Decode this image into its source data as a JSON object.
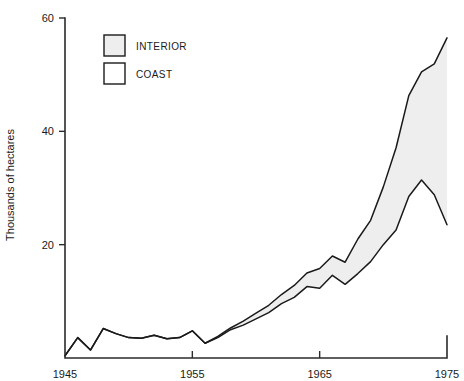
{
  "chart_data": {
    "type": "area",
    "title": "",
    "subtitle": "",
    "xlabel": "",
    "ylabel": "Thousands of hectares",
    "xlim": [
      1945,
      1975
    ],
    "ylim": [
      0,
      60
    ],
    "xticks": [
      1945,
      1955,
      1965,
      1975
    ],
    "xtick_labels": [
      "1945",
      "1955",
      "1965",
      "1975"
    ],
    "yticks": [
      20,
      40,
      60
    ],
    "ytick_labels": [
      "20",
      "40",
      "60"
    ],
    "grid": false,
    "legend_position": "top-left",
    "stacked": true,
    "x": [
      1945,
      1946,
      1947,
      1948,
      1949,
      1950,
      1951,
      1952,
      1953,
      1954,
      1955,
      1956,
      1957,
      1958,
      1959,
      1960,
      1961,
      1962,
      1963,
      1964,
      1965,
      1966,
      1967,
      1968,
      1969,
      1970,
      1971,
      1972,
      1973,
      1974,
      1975
    ],
    "series": [
      {
        "name": "COAST",
        "fill_color": "#ffffff",
        "values": [
          0.4,
          3.6,
          1.4,
          5.2,
          4.3,
          3.6,
          3.5,
          4.0,
          3.4,
          3.6,
          4.8,
          2.6,
          3.6,
          5.0,
          5.8,
          6.9,
          8.0,
          9.6,
          10.7,
          12.6,
          12.3,
          14.6,
          13.0,
          14.9,
          17.0,
          20.0,
          22.6,
          28.5,
          31.4,
          28.8,
          23.5
        ]
      },
      {
        "name": "INTERIOR",
        "fill_color": "#eeeeee",
        "values": [
          0.0,
          0.0,
          0.0,
          0.0,
          0.0,
          0.0,
          0.0,
          0.0,
          0.0,
          0.0,
          0.0,
          0.0,
          0.2,
          0.3,
          0.7,
          1.0,
          1.3,
          1.6,
          2.1,
          2.4,
          3.5,
          3.4,
          3.9,
          6.1,
          7.3,
          10.2,
          14.5,
          17.8,
          19.1,
          23.1,
          33.0
        ]
      }
    ],
    "totals": [
      0.4,
      3.6,
      1.4,
      5.2,
      4.3,
      3.6,
      3.5,
      4.0,
      3.4,
      3.6,
      4.8,
      2.6,
      3.8,
      5.3,
      6.5,
      7.9,
      9.3,
      11.2,
      12.8,
      15.0,
      15.8,
      18.0,
      16.9,
      21.0,
      24.3,
      30.2,
      37.1,
      46.3,
      50.5,
      51.9,
      56.5
    ],
    "legend": [
      {
        "label": "INTERIOR",
        "swatch": "#eeeeee"
      },
      {
        "label": "COAST",
        "swatch": "#ffffff"
      }
    ]
  },
  "axes": {
    "y_title": "Thousands of hectares"
  }
}
